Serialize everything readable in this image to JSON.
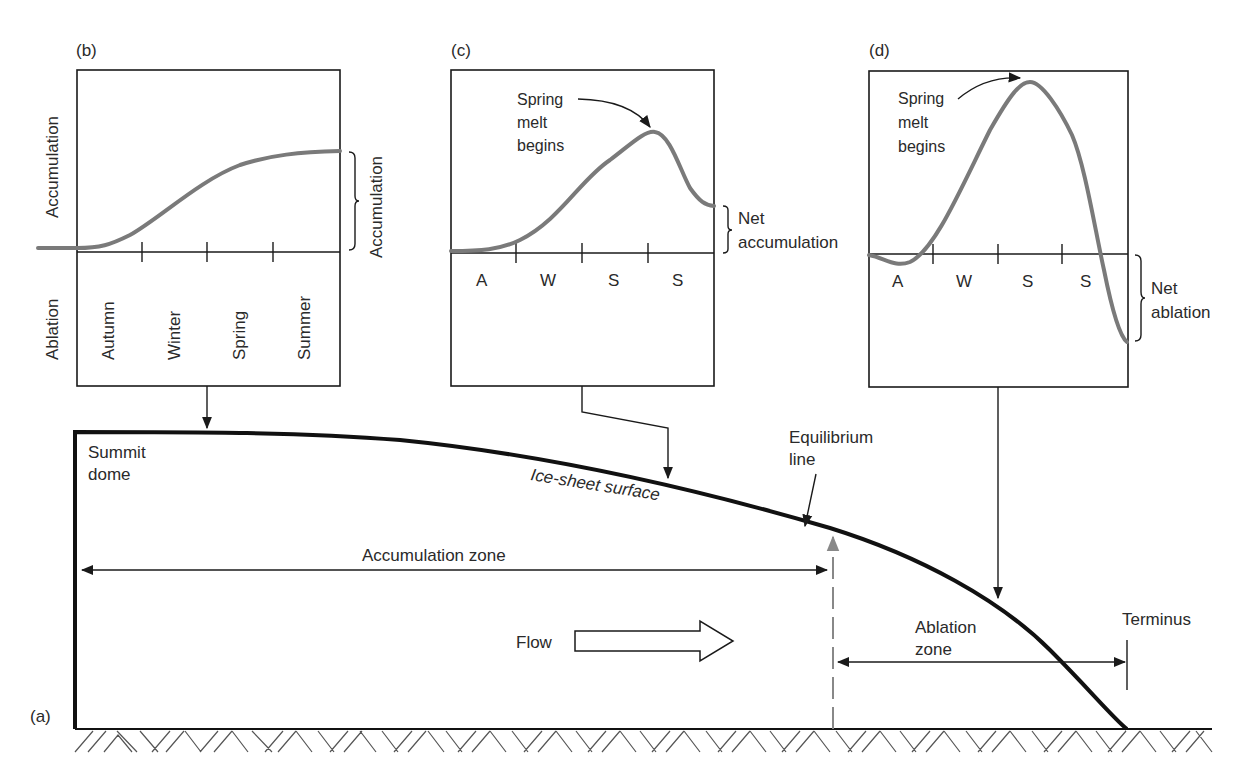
{
  "figure": {
    "panel_a": {
      "label": "(a)",
      "summit_label_1": "Summit",
      "summit_label_2": "dome",
      "surface_label": "Ice-sheet surface",
      "equilibrium_label_1": "Equilibrium",
      "equilibrium_label_2": "line",
      "accumulation_zone_label": "Accumulation zone",
      "ablation_zone_label_1": "Ablation",
      "ablation_zone_label_2": "zone",
      "flow_label": "Flow",
      "terminus_label": "Terminus"
    },
    "panel_b": {
      "label": "(b)",
      "y_top_label": "Accumulation",
      "y_bottom_label": "Ablation",
      "seasons": [
        "Autumn",
        "Winter",
        "Spring",
        "Summer"
      ],
      "bracket_label": "Accumulation"
    },
    "panel_c": {
      "label": "(c)",
      "annotation_1": "Spring",
      "annotation_2": "melt",
      "annotation_3": "begins",
      "seasons": [
        "A",
        "W",
        "S",
        "S"
      ],
      "bracket_label_1": "Net",
      "bracket_label_2": "accumulation"
    },
    "panel_d": {
      "label": "(d)",
      "annotation_1": "Spring",
      "annotation_2": "melt",
      "annotation_3": "begins",
      "seasons": [
        "A",
        "W",
        "S",
        "S"
      ],
      "bracket_label_1": "Net",
      "bracket_label_2": "ablation"
    }
  },
  "colors": {
    "curve": "#7a7a7a",
    "line": "#1a1a1a",
    "text": "#2a2a2a",
    "background": "#ffffff"
  }
}
